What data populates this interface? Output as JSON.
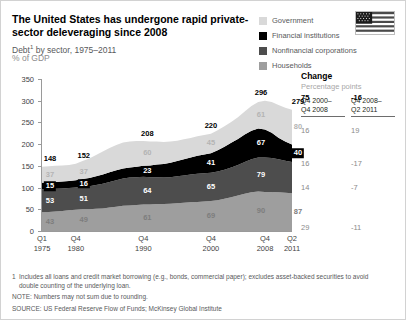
{
  "header": {
    "title": "The United States has undergone rapid private-sector deleveraging since 2008",
    "subtitle_pre": "Debt",
    "subtitle_footnote_marker": "1",
    "subtitle_post": " by sector, 1975–2011",
    "unit": "% of GDP"
  },
  "legend": {
    "items": [
      {
        "label": "Government",
        "color": "#d9d9d9",
        "key": "government"
      },
      {
        "label": "Financial institutions",
        "color": "#000000",
        "key": "financial"
      },
      {
        "label": "Nonfinancial corporations",
        "color": "#4d4d4d",
        "key": "nonfinancial"
      },
      {
        "label": "Households",
        "color": "#9e9e9e",
        "key": "households"
      }
    ]
  },
  "flag": {
    "name": "united-states-flag"
  },
  "change_table": {
    "title": "Change",
    "subtitle": "Percentage points",
    "columns": [
      {
        "line1": "Q4 2000–",
        "line2": "Q4 2008"
      },
      {
        "line1": "Q4 2008–",
        "line2": "Q2 2011"
      }
    ],
    "rows": [
      {
        "series": "total",
        "c1": "75",
        "c2": "-16",
        "emphasis": "bold"
      },
      {
        "series": "government",
        "c1": "16",
        "c2": "19",
        "emphasis": "muted"
      },
      {
        "series": "financial",
        "c1": "16",
        "c2": "-17",
        "emphasis": "muted"
      },
      {
        "series": "nonfinancial",
        "c1": "14",
        "c2": "-7",
        "emphasis": "muted"
      },
      {
        "series": "households",
        "c1": "29",
        "c2": "-11",
        "emphasis": "muted"
      }
    ]
  },
  "footnotes": {
    "fn1_num": "1",
    "fn1_line1": "Includes all loans and credit market borrowing (e.g., bonds, commercial paper); excludes asset-backed securities to avoid",
    "fn1_line2": "double counting of the underlying loan.",
    "note": "NOTE: Numbers may not sum due to rounding.",
    "source": "SOURCE: US Federal Reserve Flow of Funds; McKinsey Global Institute"
  },
  "chart_data": {
    "type": "area",
    "title": "The United States has undergone rapid private-sector deleveraging since 2008",
    "subtitle": "Debt by sector, 1975–2011",
    "xlabel": "",
    "ylabel": "% of GDP",
    "ylim": [
      0,
      350
    ],
    "yticks": [
      0,
      50,
      100,
      150,
      200,
      250,
      300,
      350
    ],
    "grid": false,
    "legend_position": "top-right",
    "stacked": true,
    "stack_order_bottom_to_top": [
      "households",
      "nonfinancial",
      "financial",
      "government"
    ],
    "x_tick_labels": [
      {
        "line1": "Q1",
        "line2": "1975"
      },
      {
        "line1": "Q4",
        "line2": "1980"
      },
      {
        "line1": "Q4",
        "line2": "1990"
      },
      {
        "line1": "Q4",
        "line2": "2000"
      },
      {
        "line1": "Q4",
        "line2": "2008"
      },
      {
        "line1": "Q2",
        "line2": "2011"
      }
    ],
    "labeled_points": [
      {
        "x_label": "Q1 1975",
        "total": 148,
        "government": 37,
        "financial": 15,
        "nonfinancial": 53,
        "households": 43
      },
      {
        "x_label": "Q4 1980",
        "total": 152,
        "government": 37,
        "financial": 16,
        "nonfinancial": 51,
        "households": 49
      },
      {
        "x_label": "Q4 1990",
        "total": 208,
        "government": 60,
        "financial": 23,
        "nonfinancial": 64,
        "households": 61
      },
      {
        "x_label": "Q4 2000",
        "total": 220,
        "government": 45,
        "financial": 41,
        "nonfinancial": 65,
        "households": 69
      },
      {
        "x_label": "Q4 2008",
        "total": 296,
        "government": 61,
        "financial": 67,
        "nonfinancial": 79,
        "households": 90
      },
      {
        "x_label": "Q2 2011",
        "total": 279,
        "government": 80,
        "financial": 40,
        "nonfinancial": 72,
        "households": 87
      }
    ],
    "series": [
      {
        "name": "Households",
        "color": "#9e9e9e",
        "values": [
          43,
          44,
          45,
          46,
          48,
          49,
          50,
          50,
          51,
          52,
          54,
          56,
          58,
          59,
          60,
          61,
          61,
          62,
          62,
          63,
          64,
          65,
          66,
          67,
          68,
          69,
          71,
          74,
          78,
          82,
          86,
          89,
          91,
          90,
          90,
          89,
          88,
          87
        ]
      },
      {
        "name": "Nonfinancial corporations",
        "color": "#4d4d4d",
        "values": [
          53,
          53,
          52,
          52,
          51,
          51,
          52,
          53,
          55,
          57,
          59,
          61,
          63,
          64,
          64,
          64,
          63,
          62,
          61,
          61,
          62,
          63,
          64,
          65,
          65,
          65,
          66,
          67,
          68,
          70,
          73,
          76,
          78,
          79,
          78,
          76,
          74,
          72
        ]
      },
      {
        "name": "Financial institutions",
        "color": "#000000",
        "values": [
          15,
          15,
          16,
          16,
          16,
          17,
          18,
          19,
          20,
          21,
          22,
          23,
          23,
          23,
          24,
          25,
          27,
          29,
          31,
          33,
          35,
          37,
          39,
          41,
          43,
          45,
          49,
          53,
          57,
          60,
          63,
          66,
          67,
          65,
          58,
          50,
          44,
          40
        ]
      },
      {
        "name": "Government",
        "color": "#d9d9d9",
        "values": [
          37,
          37,
          37,
          37,
          37,
          38,
          41,
          45,
          49,
          53,
          56,
          58,
          60,
          60,
          59,
          57,
          55,
          53,
          51,
          49,
          47,
          46,
          45,
          45,
          45,
          45,
          46,
          47,
          48,
          50,
          53,
          57,
          61,
          66,
          71,
          75,
          78,
          80
        ]
      }
    ]
  }
}
